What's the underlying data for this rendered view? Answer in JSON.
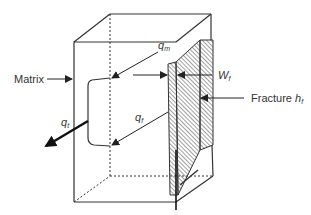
{
  "diagram": {
    "labels": {
      "matrix": "Matrix",
      "q_m_base": "q",
      "q_m_sub": "m",
      "w_f_base": "W",
      "w_f_sub": "f",
      "fracture_text": "Fracture ",
      "fracture_h_base": "h",
      "fracture_h_sub": "f",
      "q_t_base": "q",
      "q_t_sub": "t",
      "q_f_base": "q",
      "q_f_sub": "f"
    },
    "colors": {
      "line": "#333333",
      "hatch": "#555555",
      "background": "#ffffff"
    }
  }
}
